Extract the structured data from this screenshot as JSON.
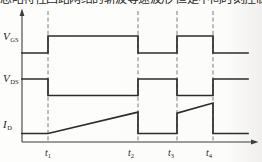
{
  "caption_clipped": "忽略特性回路网络的斩波等速波形 但是中间时刻控制",
  "chart_data": {
    "type": "line",
    "subtype": "timing-waveform-diagram",
    "title": "",
    "xlabel": "",
    "ylabel": "",
    "grid": false,
    "x_axis": {
      "span_units": 226,
      "markers": [
        {
          "name": "t1",
          "base": "t",
          "sub": "1",
          "u": 26
        },
        {
          "name": "t2",
          "base": "t",
          "sub": "2",
          "u": 116
        },
        {
          "name": "t3",
          "base": "t",
          "sub": "3",
          "u": 155
        },
        {
          "name": "t4",
          "base": "t",
          "sub": "4",
          "u": 191
        }
      ]
    },
    "series": [
      {
        "name": "vgs",
        "label_base": "V",
        "label_sub": "GS",
        "points": [
          [
            0,
            0
          ],
          [
            26,
            0
          ],
          [
            26,
            1
          ],
          [
            116,
            1
          ],
          [
            116,
            0
          ],
          [
            155,
            0
          ],
          [
            155,
            1
          ],
          [
            191,
            1
          ],
          [
            191,
            0
          ],
          [
            226,
            0
          ]
        ]
      },
      {
        "name": "vds",
        "label_base": "V",
        "label_sub": "DS",
        "points": [
          [
            0,
            1
          ],
          [
            26,
            1
          ],
          [
            26,
            0
          ],
          [
            116,
            0
          ],
          [
            116,
            1
          ],
          [
            155,
            1
          ],
          [
            155,
            0
          ],
          [
            191,
            0
          ],
          [
            191,
            1
          ],
          [
            226,
            1
          ]
        ]
      },
      {
        "name": "id",
        "label_base": "I",
        "label_sub": "D",
        "points": [
          [
            0,
            0
          ],
          [
            26,
            0
          ],
          [
            116,
            0.7
          ],
          [
            116,
            0
          ],
          [
            155,
            0
          ],
          [
            155,
            0.67
          ],
          [
            191,
            1
          ],
          [
            191,
            0
          ],
          [
            226,
            0
          ]
        ]
      }
    ],
    "colors": {
      "line": "#2c2c2c",
      "axis": "#3d3d3d",
      "dashed": "#6e6e6e",
      "text": "#1d1d1d",
      "background": "#fcfcfb"
    }
  }
}
